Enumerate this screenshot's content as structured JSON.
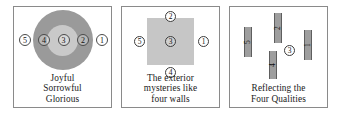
{
  "figure": {
    "background_color": "#ffffff",
    "panel_border_color": "#8a8a8a"
  },
  "panels": [
    {
      "id": "concentric-circles",
      "diagram_type": "concentric-circles",
      "outer_ring_color": "#9a9a9a",
      "inner_circle_color": "#c9c9c9",
      "numbers": [
        "5",
        "4",
        "3",
        "2",
        "1"
      ],
      "caption_lines": [
        "Joyful",
        "Sorrowful",
        "Glorious"
      ]
    },
    {
      "id": "square-four-walls",
      "diagram_type": "square-with-surrounding-numbers",
      "square_color": "#c6c6c6",
      "number_top": "2",
      "number_left": "5",
      "number_center": "3",
      "number_right": "1",
      "number_bottom": "4",
      "caption_lines": [
        "The exterior",
        "mysteries like",
        "four walls"
      ]
    },
    {
      "id": "four-mirrors",
      "diagram_type": "mirrors-with-center-circle",
      "mirror_color": "#9e9e9e",
      "mirrors": [
        {
          "label": "5"
        },
        {
          "label": "2"
        },
        {
          "label": "4"
        },
        {
          "label": "1"
        }
      ],
      "center_number": "3",
      "caption_lines": [
        "Reflecting the",
        "Four Qualities"
      ]
    }
  ]
}
